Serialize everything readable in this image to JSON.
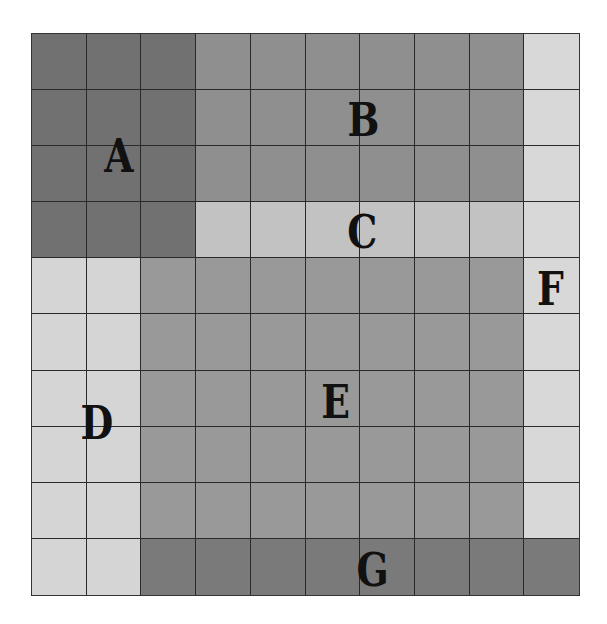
{
  "diagram": {
    "type": "grid-regions",
    "rows": 10,
    "cols": 10,
    "regions": [
      {
        "id": "A",
        "label": "A",
        "color": "#717171",
        "row_start": 1,
        "row_end": 4,
        "col_start": 1,
        "col_end": 3,
        "label_pos": {
          "x": 118,
          "y": 157
        }
      },
      {
        "id": "B",
        "label": "B",
        "color": "#8f8f8f",
        "row_start": 1,
        "row_end": 3,
        "col_start": 4,
        "col_end": 9,
        "label_pos": {
          "x": 361,
          "y": 121
        }
      },
      {
        "id": "C",
        "label": "C",
        "color": "#c2c2c2",
        "row_start": 4,
        "row_end": 4,
        "col_start": 4,
        "col_end": 9,
        "label_pos": {
          "x": 361,
          "y": 233
        }
      },
      {
        "id": "D",
        "label": "D",
        "color": "#d5d5d5",
        "row_start": 5,
        "row_end": 10,
        "col_start": 1,
        "col_end": 2,
        "label_pos": {
          "x": 94,
          "y": 424
        }
      },
      {
        "id": "E",
        "label": "E",
        "color": "#999999",
        "row_start": 5,
        "row_end": 9,
        "col_start": 3,
        "col_end": 9,
        "label_pos": {
          "x": 335,
          "y": 403
        }
      },
      {
        "id": "F",
        "label": "F",
        "color": "#d8d8d8",
        "row_start": 1,
        "row_end": 9,
        "col_start": 10,
        "col_end": 10,
        "label_pos": {
          "x": 551,
          "y": 290
        }
      },
      {
        "id": "G",
        "label": "G",
        "color": "#7a7a7a",
        "row_start": 10,
        "row_end": 10,
        "col_start": 3,
        "col_end": 10,
        "label_pos": {
          "x": 370,
          "y": 571
        }
      }
    ]
  }
}
